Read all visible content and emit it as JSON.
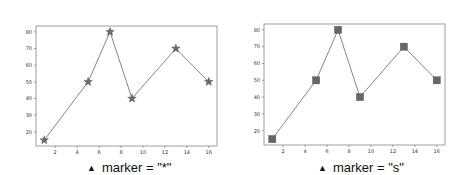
{
  "chart_data": [
    {
      "type": "line",
      "title": "",
      "xlabel": "",
      "ylabel": "",
      "x": [
        1,
        5,
        7,
        9,
        13,
        16
      ],
      "series": [
        {
          "name": "data",
          "values": [
            15,
            50,
            80,
            40,
            70,
            50
          ],
          "marker": "*",
          "color": "#555555"
        }
      ],
      "xticks": [
        2,
        4,
        6,
        8,
        10,
        12,
        14,
        16
      ],
      "yticks": [
        20,
        30,
        40,
        50,
        60,
        70,
        80
      ],
      "xlim": [
        0.25,
        16.75
      ],
      "ylim": [
        11.5,
        83.5
      ],
      "grid": false,
      "caption": "marker = \"*\""
    },
    {
      "type": "line",
      "title": "",
      "xlabel": "",
      "ylabel": "",
      "x": [
        1,
        5,
        7,
        9,
        13,
        16
      ],
      "series": [
        {
          "name": "data",
          "values": [
            15,
            50,
            80,
            40,
            70,
            50
          ],
          "marker": "s",
          "color": "#555555"
        }
      ],
      "xticks": [
        2,
        4,
        6,
        8,
        10,
        12,
        14,
        16
      ],
      "yticks": [
        20,
        30,
        40,
        50,
        60,
        70,
        80
      ],
      "xlim": [
        0.25,
        16.75
      ],
      "ylim": [
        11.5,
        83.5
      ],
      "grid": false,
      "caption": "marker = \"s\""
    }
  ],
  "captions": {
    "left": "marker = \"*\"",
    "right": "marker = \"s\"",
    "bullet": "▲"
  }
}
